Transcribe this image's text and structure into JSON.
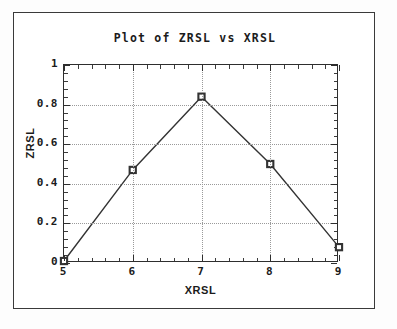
{
  "figure": {
    "title": "Plot of ZRSL vs XRSL",
    "frame_color": "#3a3a3a",
    "axis_color": "#2e2e2e",
    "grid_color": "#9a9a9a",
    "series_color": "#333333",
    "background": "#ffffff"
  },
  "chart_data": {
    "type": "line",
    "title": "Plot of ZRSL vs XRSL",
    "xlabel": "XRSL",
    "ylabel": "ZRSL",
    "x": [
      5,
      6,
      7,
      8,
      9
    ],
    "values": [
      0.01,
      0.47,
      0.84,
      0.5,
      0.08
    ],
    "series": [
      {
        "name": "ZRSL",
        "values": [
          0.01,
          0.47,
          0.84,
          0.5,
          0.08
        ]
      }
    ],
    "xlim": [
      5,
      9
    ],
    "ylim": [
      0,
      1
    ],
    "xticks": [
      5,
      6,
      7,
      8,
      9
    ],
    "xtick_labels": [
      "5",
      "6",
      "7",
      "8",
      "9"
    ],
    "yticks": [
      0,
      0.2,
      0.4,
      0.6,
      0.8,
      1
    ],
    "ytick_labels": [
      "0",
      "0.2",
      "0.4",
      "0.6",
      "0.8",
      "1"
    ],
    "x_minor_per_major": 5,
    "y_minor_per_major": 5,
    "grid": true,
    "grid_style": "dotted",
    "legend": null,
    "marker": "square-open",
    "line_style": "solid"
  }
}
